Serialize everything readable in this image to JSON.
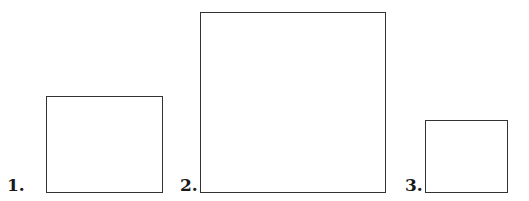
{
  "figures": [
    {
      "label": "1.",
      "shape": "rectangle",
      "box": {
        "x": 46,
        "y": 96,
        "w": 117,
        "h": 97
      },
      "label_pos": {
        "x": 7,
        "y": 177
      }
    },
    {
      "label": "2.",
      "shape": "square",
      "box": {
        "x": 200,
        "y": 12,
        "w": 186,
        "h": 181
      },
      "label_pos": {
        "x": 180,
        "y": 177
      }
    },
    {
      "label": "3.",
      "shape": "square",
      "box": {
        "x": 425,
        "y": 120,
        "w": 83,
        "h": 73
      },
      "label_pos": {
        "x": 405,
        "y": 177
      }
    }
  ],
  "colors": {
    "stroke": "#333333",
    "text": "#1a1a1a",
    "background": "#ffffff"
  }
}
